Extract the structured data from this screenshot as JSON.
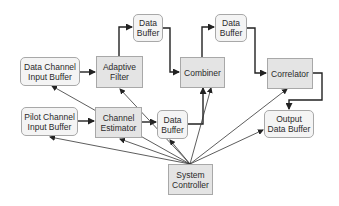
{
  "diagram": {
    "type": "block-diagram",
    "nodes": [
      {
        "id": "data_channel_input_buffer",
        "label_line1": "Data Channel",
        "label_line2": "Input Buffer",
        "kind": "buffer"
      },
      {
        "id": "adaptive_filter",
        "label_line1": "Adaptive",
        "label_line2": "Filter",
        "kind": "process"
      },
      {
        "id": "data_buffer_top_left",
        "label_line1": "Data",
        "label_line2": "Buffer",
        "kind": "buffer"
      },
      {
        "id": "combiner",
        "label_line1": "Combiner",
        "label_line2": "",
        "kind": "process"
      },
      {
        "id": "data_buffer_top_right",
        "label_line1": "Data",
        "label_line2": "Buffer",
        "kind": "buffer"
      },
      {
        "id": "correlator",
        "label_line1": "Correlator",
        "label_line2": "",
        "kind": "process"
      },
      {
        "id": "pilot_channel_input_buffer",
        "label_line1": "Pilot Channel",
        "label_line2": "Input Buffer",
        "kind": "buffer"
      },
      {
        "id": "channel_estimator",
        "label_line1": "Channel",
        "label_line2": "Estimator",
        "kind": "process"
      },
      {
        "id": "data_buffer_middle",
        "label_line1": "Data",
        "label_line2": "Buffer",
        "kind": "buffer"
      },
      {
        "id": "output_data_buffer",
        "label_line1": "Output",
        "label_line2": "Data Buffer",
        "kind": "buffer"
      },
      {
        "id": "system_controller",
        "label_line1": "System",
        "label_line2": "Controller",
        "kind": "process"
      }
    ],
    "edges": [
      {
        "from": "data_channel_input_buffer",
        "to": "adaptive_filter"
      },
      {
        "from": "adaptive_filter",
        "to": "data_buffer_top_left"
      },
      {
        "from": "data_buffer_top_left",
        "to": "combiner"
      },
      {
        "from": "combiner",
        "to": "data_buffer_top_right"
      },
      {
        "from": "data_buffer_top_right",
        "to": "correlator"
      },
      {
        "from": "correlator",
        "to": "output_data_buffer"
      },
      {
        "from": "pilot_channel_input_buffer",
        "to": "channel_estimator"
      },
      {
        "from": "channel_estimator",
        "to": "data_buffer_middle"
      },
      {
        "from": "data_buffer_middle",
        "to": "combiner"
      },
      {
        "from": "system_controller",
        "to": "data_channel_input_buffer"
      },
      {
        "from": "system_controller",
        "to": "adaptive_filter"
      },
      {
        "from": "system_controller",
        "to": "pilot_channel_input_buffer"
      },
      {
        "from": "system_controller",
        "to": "channel_estimator"
      },
      {
        "from": "system_controller",
        "to": "data_buffer_middle"
      },
      {
        "from": "system_controller",
        "to": "combiner"
      },
      {
        "from": "system_controller",
        "to": "correlator"
      },
      {
        "from": "system_controller",
        "to": "output_data_buffer"
      }
    ]
  },
  "colors": {
    "buffer_fill": "#f4f4f4",
    "process_fill": "#e4e4e4",
    "border": "#a8a8a8",
    "arrow": "#222222",
    "text": "#2a2a2a"
  }
}
